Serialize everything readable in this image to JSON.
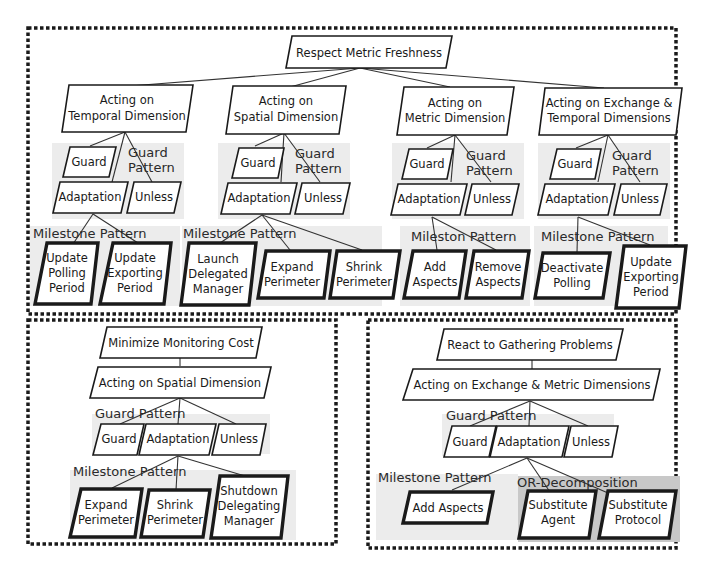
{
  "figure": {
    "panels": [
      {
        "id": "top",
        "root": "Respect Metric Freshness",
        "branches": [
          {
            "title_lines": [
              "Acting on",
              "Temporal Dimension"
            ],
            "guard_pattern_label": [
              "Guard",
              "Pattern"
            ],
            "guard": "Guard",
            "adaptation": "Adaptation",
            "unless": "Unless",
            "milestone_pattern_label": "Milestone Pattern",
            "milestones": [
              {
                "lines": [
                  "Update",
                  "Polling",
                  "Period"
                ]
              },
              {
                "lines": [
                  "Update",
                  "Exporting",
                  "Period"
                ]
              }
            ]
          },
          {
            "title_lines": [
              "Acting on",
              "Spatial Dimension"
            ],
            "guard_pattern_label": [
              "Guard",
              "Pattern"
            ],
            "guard": "Guard",
            "adaptation": "Adaptation",
            "unless": "Unless",
            "milestone_pattern_label": "Milestone Pattern",
            "milestones": [
              {
                "lines": [
                  "Launch",
                  "Delegated",
                  "Manager"
                ]
              },
              {
                "lines": [
                  "Expand",
                  "Perimeter"
                ]
              },
              {
                "lines": [
                  "Shrink",
                  "Perimeter"
                ]
              }
            ]
          },
          {
            "title_lines": [
              "Acting on",
              "Metric Dimension"
            ],
            "guard_pattern_label": [
              "Guard",
              "Pattern"
            ],
            "guard": "Guard",
            "adaptation": "Adaptation",
            "unless": "Unless",
            "milestone_pattern_label": "Mileston Pattern",
            "milestones": [
              {
                "lines": [
                  "Add",
                  "Aspects"
                ]
              },
              {
                "lines": [
                  "Remove",
                  "Aspects"
                ]
              }
            ]
          },
          {
            "title_lines": [
              "Acting on Exchange &",
              "Temporal Dimensions"
            ],
            "guard_pattern_label": [
              "Guard",
              "Pattern"
            ],
            "guard": "Guard",
            "adaptation": "Adaptation",
            "unless": "Unless",
            "milestone_pattern_label": "Milestone Pattern",
            "milestones": [
              {
                "lines": [
                  "Deactivate",
                  "Polling"
                ]
              },
              {
                "lines": [
                  "Update",
                  "Exporting",
                  "Period"
                ]
              }
            ]
          }
        ]
      },
      {
        "id": "bottom-left",
        "root": "Minimize Monitoring Cost",
        "branch_title": "Acting on Spatial Dimension",
        "guard_pattern_label": "Guard Pattern",
        "guard": "Guard",
        "adaptation": "Adaptation",
        "unless": "Unless",
        "milestone_pattern_label": "Milestone Pattern",
        "milestones": [
          {
            "lines": [
              "Expand",
              "Perimeter"
            ]
          },
          {
            "lines": [
              "Shrink",
              "Perimeter"
            ]
          },
          {
            "lines": [
              "Shutdown",
              "Delegating",
              "Manager"
            ]
          }
        ]
      },
      {
        "id": "bottom-right",
        "root": "React to Gathering Problems",
        "branch_title": "Acting on Exchange & Metric Dimensions",
        "guard_pattern_label": "Guard Pattern",
        "guard": "Guard",
        "adaptation": "Adaptation",
        "unless": "Unless",
        "milestone_pattern_label": "Milestone Pattern",
        "milestones": [
          {
            "lines": [
              "Add Aspects"
            ]
          }
        ],
        "or_decomposition_label": "OR-Decomposition",
        "or_options": [
          {
            "lines": [
              "Substitute",
              "Agent"
            ]
          },
          {
            "lines": [
              "Substitute",
              "Protocol"
            ]
          }
        ]
      }
    ]
  }
}
